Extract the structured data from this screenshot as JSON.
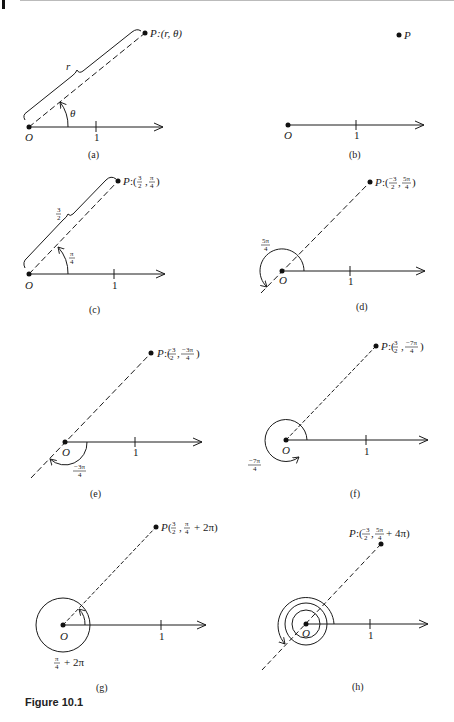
{
  "figure": {
    "caption": "Figure 10.1",
    "panels": [
      {
        "id": "a",
        "label": "(a)",
        "point_label": "P:(r, θ)",
        "radius_label": "r",
        "angle_label": "θ",
        "origin_label": "O",
        "tick_label": "1"
      },
      {
        "id": "b",
        "label": "(b)",
        "point_label": "P",
        "origin_label": "O",
        "tick_label": "1"
      },
      {
        "id": "c",
        "label": "(c)",
        "point_label": "P:(3/2, π/4)",
        "radius_label": "3/2",
        "angle_label": "π/4",
        "origin_label": "O",
        "tick_label": "1"
      },
      {
        "id": "d",
        "label": "(d)",
        "point_label": "P:(−3/2, 5π/4)",
        "angle_label": "5π/4",
        "origin_label": "O",
        "tick_label": "1"
      },
      {
        "id": "e",
        "label": "(e)",
        "point_label": "P:(−3/2, −3π/4)",
        "angle_label": "−3π/4",
        "origin_label": "O",
        "tick_label": "1"
      },
      {
        "id": "f",
        "label": "(f)",
        "point_label": "P:(3/2, −7π/4)",
        "angle_label": "−7π/4",
        "origin_label": "O",
        "tick_label": "1"
      },
      {
        "id": "g",
        "label": "(g)",
        "point_label": "P(3/2, π/4 + 2π)",
        "angle_label": "π/4 + 2π",
        "origin_label": "O",
        "tick_label": "1"
      },
      {
        "id": "h",
        "label": "(h)",
        "point_label": "P:(−3/2, 5π/4 + 4π)",
        "origin_label": "O",
        "tick_label": "1"
      }
    ],
    "text": {
      "a_P": "P",
      "a_coords": ":(r, θ)",
      "a_r": "r",
      "a_theta": "θ",
      "b_P": "P",
      "c_P": "P",
      "c_pre": ":(",
      "c_r_num": "3",
      "c_r_den": "2",
      "c_th_num": "π",
      "c_th_den": "4",
      "c_close": ")",
      "c_rad_num": "3",
      "c_rad_den": "2",
      "c_ang_num": "π",
      "c_ang_den": "4",
      "d_P": "P",
      "d_pre": ":(",
      "d_r_num": "−3",
      "d_r_den": "2",
      "d_th_num": "5π",
      "d_th_den": "4",
      "d_close": ")",
      "d_ang_num": "5π",
      "d_ang_den": "4",
      "e_P": "P",
      "e_pre": ":(",
      "e_r_num": "−3",
      "e_r_den": "2",
      "e_th_num": "−3π",
      "e_th_den": "4",
      "e_close": ")",
      "e_ang_num": "−3π",
      "e_ang_den": "4",
      "f_P": "P",
      "f_pre": ":(",
      "f_r_num": "3",
      "f_r_den": "2",
      "f_th_num": "−7π",
      "f_th_den": "4",
      "f_close": ")",
      "f_ang_num": "−7π",
      "f_ang_den": "4",
      "g_P": "P",
      "g_pre": "(",
      "g_r_num": "3",
      "g_r_den": "2",
      "g_th_num": "π",
      "g_th_den": "4",
      "g_tail": "+ 2π)",
      "g_ang_num": "π",
      "g_ang_den": "4",
      "g_ang_tail": "+ 2π",
      "h_P": "P",
      "h_pre": ":(",
      "h_r_num": "−3",
      "h_r_den": "2",
      "h_th_num": "5π",
      "h_th_den": "4",
      "h_tail": "+ 4π)",
      "O": "O",
      "one": "1",
      "cap_a": "(a)",
      "cap_b": "(b)",
      "cap_c": "(c)",
      "cap_d": "(d)",
      "cap_e": "(e)",
      "cap_f": "(f)",
      "cap_g": "(g)",
      "cap_h": "(h)"
    }
  }
}
